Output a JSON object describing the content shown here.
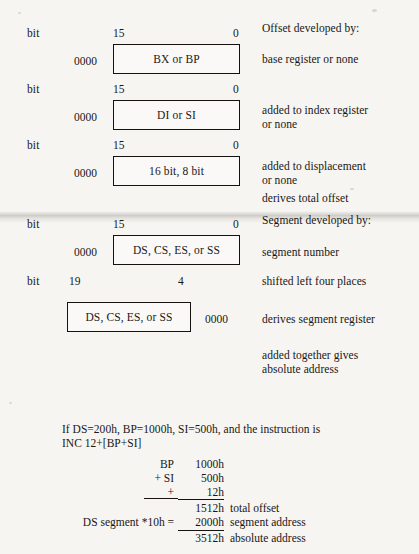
{
  "figure": {
    "rows": [
      {
        "bit_label": "bit",
        "high_bit": "15",
        "low_bit": "0",
        "zeros": "0000",
        "box_text": "BX or BP",
        "description": "base register or none"
      },
      {
        "bit_label": "bit",
        "high_bit": "15",
        "low_bit": "0",
        "zeros": "0000",
        "box_text": "DI or SI",
        "description": "added to index register\nor none"
      },
      {
        "bit_label": "bit",
        "high_bit": "15",
        "low_bit": "0",
        "zeros": "0000",
        "box_text": "16 bit, 8 bit",
        "description": "added to displacement\nor none"
      },
      {
        "bit_label": "bit",
        "high_bit": "15",
        "low_bit": "0",
        "zeros": "0000",
        "box_text": "DS, CS, ES, or SS",
        "description": "segment number"
      },
      {
        "bit_label": "bit",
        "high_bit": "19",
        "low_bit": "4",
        "zeros": "0000",
        "box_text": "DS, CS, ES, or SS",
        "description": "derives segment register"
      }
    ],
    "headings": {
      "offset": "Offset developed by:",
      "segment": "Segment developed by:"
    },
    "notes": {
      "derives_total_offset": "derives total offset",
      "shifted_left": "shifted left four places",
      "added_together": "added together gives\nabsolute address"
    }
  },
  "example": {
    "intro": "If DS=200h, BP=1000h, SI=500h, and the instruction is\nINC 12+[BP+SI]",
    "calc_rows": [
      {
        "op": "BP",
        "value": "1000h",
        "note": ""
      },
      {
        "op": "+ SI",
        "value": "500h",
        "note": ""
      },
      {
        "op": "+",
        "value": "12h",
        "note": ""
      },
      {
        "op": "",
        "value": "1512h",
        "note": "total offset"
      },
      {
        "op": "DS segment *10h =",
        "value": "2000h",
        "note": "segment address"
      },
      {
        "op": "",
        "value": "3512h",
        "note": "absolute address"
      }
    ]
  },
  "colors": {
    "ink": "#1a1715",
    "paper": "#f6f5f2",
    "box_fill": "#faf9f7"
  }
}
